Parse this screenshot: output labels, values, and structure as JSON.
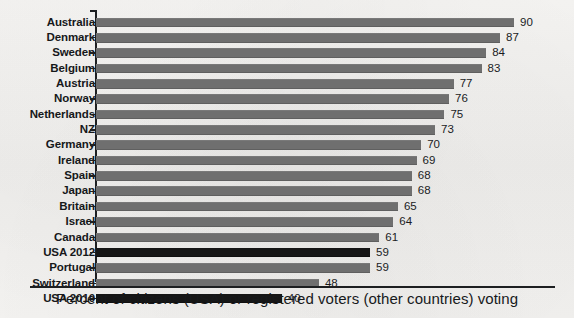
{
  "chart_data": {
    "type": "bar",
    "orientation": "horizontal",
    "title": "",
    "subtitle": "",
    "xlabel": "Percent of citizens (USA) or registered voters (other countries) voting",
    "ylabel": "",
    "xlim": [
      0,
      90
    ],
    "grid": false,
    "legend": "none",
    "categories": [
      "Australia",
      "Denmark",
      "Sweden",
      "Belgium",
      "Austria",
      "Norway",
      "Netherlands",
      "NZ",
      "Germany",
      "Ireland",
      "Spain",
      "Japan",
      "Britain",
      "Israel",
      "Canada",
      "USA 2012",
      "Portugal",
      "Switzerland",
      "USA 2010"
    ],
    "values": [
      90,
      87,
      84,
      83,
      77,
      76,
      75,
      73,
      70,
      69,
      68,
      68,
      65,
      64,
      61,
      59,
      59,
      48,
      40
    ],
    "value_labels": [
      "90",
      "87",
      "84",
      "83",
      "77",
      "76",
      "75",
      "73",
      "70",
      "69",
      "68",
      "68",
      "65",
      "64",
      "61",
      "59",
      "59",
      "48",
      "40"
    ],
    "highlighted": [
      "USA 2012",
      "USA 2010"
    ],
    "colors": {
      "bar": "#6f6f6f",
      "bar_highlight": "#161616",
      "axis": "#1d1f21",
      "text": "#17191b",
      "background": "#f2f1ef"
    }
  },
  "caption": {
    "text": "Percent of citizens (USA) or registered voters (other countries) voting"
  }
}
